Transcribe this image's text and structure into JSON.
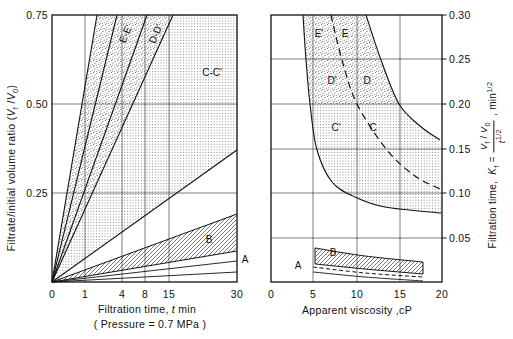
{
  "figure": {
    "width": 513,
    "height": 339,
    "background": "#ffffff",
    "ink": "#111111",
    "texture_colors": {
      "stipple_dot": "#4a4a4a",
      "grid_dot": "#5a5a5a",
      "hatch_line": "#2e2e2e"
    }
  },
  "left_panel": {
    "plot": {
      "x0": 52,
      "y0": 15,
      "x1": 237,
      "y1": 282
    },
    "origin_px": [
      52,
      282
    ],
    "x_axis": {
      "label_html": "Filtration time, <i>t</i> min",
      "sublabel": "( Pressure = 0.7 MPa )",
      "ticks": [
        {
          "label": "0",
          "px": 52
        },
        {
          "label": "1",
          "px": 85
        },
        {
          "label": "4",
          "px": 122
        },
        {
          "label": "8",
          "px": 145
        },
        {
          "label": "15",
          "px": 169
        },
        {
          "label": "30",
          "px": 237
        }
      ]
    },
    "y_axis": {
      "label_html": "Filtrate/initial volume ratio (<i>V</i><sub>f</sub> /<i>V</i><sub>0</sub>)",
      "ticks": [
        {
          "label": "0.75",
          "px": 15
        },
        {
          "label": "0.50",
          "px": 104
        },
        {
          "label": "0.25",
          "px": 193
        }
      ]
    },
    "grid_x_px": [
      85,
      122,
      145,
      169
    ],
    "grid_y_px": [
      104,
      193
    ],
    "fan_lines": [
      {
        "name": "line-E-prime",
        "end": [
          97,
          15
        ],
        "w": 1.1
      },
      {
        "name": "line-E",
        "end": [
          117,
          15
        ],
        "w": 1.1
      },
      {
        "name": "line-D-prime",
        "end": [
          147,
          15
        ],
        "w": 1.1
      },
      {
        "name": "line-D-Cprime",
        "end": [
          173,
          15
        ],
        "w": 1.1
      },
      {
        "name": "line-C",
        "end": [
          237,
          150
        ],
        "w": 1.1
      },
      {
        "name": "line-B-top",
        "end": [
          237,
          214
        ],
        "w": 1.0
      },
      {
        "name": "line-B-bottom",
        "end": [
          237,
          251
        ],
        "w": 1.0
      },
      {
        "name": "line-A-upper",
        "end": [
          237,
          261
        ],
        "w": 0.9
      },
      {
        "name": "line-A-lower",
        "end": [
          237,
          272
        ],
        "w": 0.9
      }
    ],
    "regions": {
      "stipple_poly": [
        [
          52,
          282
        ],
        [
          97,
          15
        ],
        [
          173,
          15
        ]
      ],
      "grid_poly": [
        [
          52,
          282
        ],
        [
          173,
          15
        ],
        [
          237,
          15
        ],
        [
          237,
          150
        ]
      ],
      "hatch_poly": [
        [
          52,
          282
        ],
        [
          237,
          214
        ],
        [
          237,
          251
        ]
      ]
    },
    "labels": [
      {
        "text": "E-E'",
        "x": 126,
        "y": 34,
        "rot": -66
      },
      {
        "text": "D-D'",
        "x": 156,
        "y": 34,
        "rot": -66
      },
      {
        "text": "C-C'",
        "x": 212,
        "y": 73,
        "rot": 0
      },
      {
        "text": "B",
        "x": 209,
        "y": 240,
        "rot": 0
      },
      {
        "text": "A",
        "x": 245,
        "y": 260,
        "rot": 0
      }
    ]
  },
  "right_panel": {
    "plot": {
      "x0": 271,
      "y0": 15,
      "x1": 442,
      "y1": 282
    },
    "x_axis": {
      "label": "Apparent viscosity ,cP",
      "ticks": [
        {
          "label": "0",
          "px": 271
        },
        {
          "label": "5",
          "px": 313
        },
        {
          "label": "10",
          "px": 357
        },
        {
          "label": "15",
          "px": 400
        },
        {
          "label": "20",
          "px": 442
        }
      ]
    },
    "y_axis": {
      "label_prefix_html": "Filtration time,&nbsp; <i>K</i><sub>f</sub> =",
      "frac_num_html": "<i>V</i><sub>f</sub> / <i>V</i><sub>0</sub>",
      "frac_den_html": "<i>t</i><sup>1/2</sup>",
      "label_suffix_html": ", min<sup>1/2</sup>",
      "ticks": [
        {
          "label": "0.30",
          "px": 15
        },
        {
          "label": "0.25",
          "px": 59
        },
        {
          "label": "0.20",
          "px": 104
        },
        {
          "label": "0.15",
          "px": 149
        },
        {
          "label": "0.10",
          "px": 193
        },
        {
          "label": "0.05",
          "px": 238
        }
      ]
    },
    "grid_x_px": [
      313,
      357,
      400
    ],
    "grid_y_px": [
      59,
      104,
      149,
      193,
      238
    ],
    "texture_split_y": 104,
    "curves": {
      "band_bottom": [
        [
          303,
          15
        ],
        [
          306,
          60
        ],
        [
          310,
          104
        ],
        [
          317,
          150
        ],
        [
          332,
          182
        ],
        [
          355,
          197
        ],
        [
          385,
          207
        ],
        [
          441,
          213
        ]
      ],
      "band_middle_dashed": [
        [
          331,
          15
        ],
        [
          342,
          60
        ],
        [
          357,
          104
        ],
        [
          387,
          150
        ],
        [
          415,
          176
        ],
        [
          440,
          189
        ]
      ],
      "band_top": [
        [
          366,
          15
        ],
        [
          381,
          60
        ],
        [
          399,
          104
        ],
        [
          420,
          126
        ],
        [
          440,
          140
        ]
      ],
      "b_band_top": [
        [
          315,
          248
        ],
        [
          365,
          256
        ],
        [
          423,
          262
        ]
      ],
      "b_band_bottom": [
        [
          315,
          264
        ],
        [
          365,
          269
        ],
        [
          423,
          274
        ]
      ],
      "a_dashed": [
        [
          313,
          267
        ],
        [
          365,
          273
        ],
        [
          423,
          277
        ]
      ],
      "a_solid": [
        [
          313,
          272
        ],
        [
          365,
          277
        ],
        [
          423,
          281
        ]
      ]
    },
    "labels": [
      {
        "text": "E'",
        "x": 319,
        "y": 34,
        "rot": 0
      },
      {
        "text": "E",
        "x": 345,
        "y": 34,
        "rot": 0
      },
      {
        "text": "D'",
        "x": 332,
        "y": 81,
        "rot": 0
      },
      {
        "text": "D",
        "x": 367,
        "y": 81,
        "rot": 0
      },
      {
        "text": "C'",
        "x": 336,
        "y": 128,
        "rot": 0
      },
      {
        "text": "C",
        "x": 373,
        "y": 128,
        "rot": 0
      },
      {
        "text": "B",
        "x": 333,
        "y": 253,
        "rot": 0
      },
      {
        "text": "A",
        "x": 298,
        "y": 266,
        "rot": 0
      }
    ]
  },
  "chart_data": [
    {
      "type": "area",
      "title": "Filtrate volume ratio vs filtration time (Pressure = 0.7 MPa)",
      "xlabel": "Filtration time, t min",
      "ylabel": "Filtrate/initial volume ratio (Vf/V0)",
      "x_ticks": [
        0,
        1,
        4,
        8,
        15,
        30
      ],
      "x_scale": "nonlinear (approximately square-root)",
      "ylim": [
        0,
        0.75
      ],
      "grid": true,
      "bands": [
        {
          "name": "E-E'",
          "fill": "stipple",
          "boundary_lines_reach": "Vf/V0 = 0.75 at t ≈ 2.0 and 3.6 min"
        },
        {
          "name": "D-D'",
          "fill": "stipple",
          "boundary_lines_reach": "Vf/V0 = 0.75 at t ≈ 8.6 and 16 min"
        },
        {
          "name": "C-C'",
          "fill": "fine-grid",
          "extent": "from Vf/V0 = 0.75 at t ≈ 16 min down to Vf/V0 ≈ 0.37 at t = 30 min"
        },
        {
          "name": "B",
          "fill": "diagonal-hatch",
          "extent": "Vf/V0 ≈ 0.085 – 0.19 at t = 30 min"
        },
        {
          "name": "A",
          "fill": "none",
          "extent": "Vf/V0 ≈ 0.03 – 0.055 at t = 30 min"
        }
      ],
      "note": "All boundary lines radiate from the origin (0,0)."
    },
    {
      "type": "line",
      "title": "Filtration coefficient vs apparent viscosity",
      "xlabel": "Apparent viscosity, cP",
      "ylabel": "Filtration time, Kf = (Vf/V0)/t^(1/2), min^(1/2)",
      "xlim": [
        0,
        20
      ],
      "ylim": [
        0,
        0.3
      ],
      "grid": true,
      "series": [
        {
          "name": "band lower boundary (solid)",
          "points": [
            [
              3.7,
              0.3
            ],
            [
              4.1,
              0.249
            ],
            [
              4.6,
              0.2
            ],
            [
              5.4,
              0.148
            ],
            [
              7.1,
              0.112
            ],
            [
              9.8,
              0.096
            ],
            [
              13.3,
              0.084
            ],
            [
              19.9,
              0.078
            ]
          ]
        },
        {
          "name": "primed/unprimed divider (dashed)",
          "points": [
            [
              7.0,
              0.3
            ],
            [
              8.3,
              0.249
            ],
            [
              10.1,
              0.2
            ],
            [
              13.6,
              0.148
            ],
            [
              16.8,
              0.119
            ],
            [
              19.8,
              0.105
            ]
          ]
        },
        {
          "name": "band upper boundary (solid)",
          "points": [
            [
              11.1,
              0.3
            ],
            [
              12.9,
              0.249
            ],
            [
              15.0,
              0.2
            ],
            [
              17.4,
              0.175
            ],
            [
              19.8,
              0.16
            ]
          ]
        },
        {
          "name": "B band top",
          "points": [
            [
              5.2,
              0.038
            ],
            [
              11.0,
              0.029
            ],
            [
              17.8,
              0.023
            ]
          ]
        },
        {
          "name": "B band bottom",
          "points": [
            [
              5.2,
              0.02
            ],
            [
              11.0,
              0.015
            ],
            [
              17.8,
              0.009
            ]
          ]
        },
        {
          "name": "A (dashed)",
          "points": [
            [
              4.9,
              0.017
            ],
            [
              11.0,
              0.01
            ],
            [
              17.8,
              0.006
            ]
          ]
        },
        {
          "name": "A (solid)",
          "points": [
            [
              4.9,
              0.011
            ],
            [
              11.0,
              0.006
            ],
            [
              17.8,
              0.001
            ]
          ]
        }
      ],
      "regions": [
        "E'",
        "E",
        "D'",
        "D",
        "C'",
        "C",
        "B",
        "A"
      ],
      "texture": "stipple above Kf = 0.20, fine-grid below 0.20, diagonal hatch for B"
    }
  ]
}
